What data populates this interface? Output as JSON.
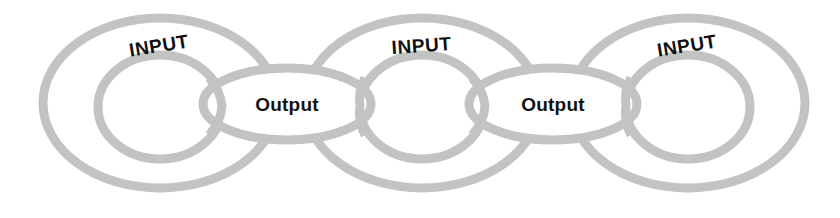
{
  "diagram": {
    "type": "chain-link-ellipses",
    "background_color": "#ffffff",
    "stroke_color": "#c3c3c3",
    "text_color": "#111111",
    "canvas": {
      "width": 840,
      "height": 218
    },
    "input_groups": [
      {
        "id": "input-group-1",
        "label": "INPUT",
        "label_rotation_deg": -9,
        "label_x": 160,
        "label_y": 52,
        "outer_ellipse": {
          "cx": 160,
          "cy": 103,
          "rx": 117,
          "ry": 85
        },
        "inner_ellipse": {
          "cx": 160,
          "cy": 107,
          "rx": 62,
          "ry": 52
        }
      },
      {
        "id": "input-group-2",
        "label": "INPUT",
        "label_rotation_deg": -4,
        "label_x": 422,
        "label_y": 52,
        "outer_ellipse": {
          "cx": 422,
          "cy": 103,
          "rx": 117,
          "ry": 85
        },
        "inner_ellipse": {
          "cx": 422,
          "cy": 107,
          "rx": 62,
          "ry": 52
        }
      },
      {
        "id": "input-group-3",
        "label": "INPUT",
        "label_rotation_deg": -9,
        "label_x": 688,
        "label_y": 52,
        "outer_ellipse": {
          "cx": 688,
          "cy": 103,
          "rx": 117,
          "ry": 85
        },
        "inner_ellipse": {
          "cx": 688,
          "cy": 107,
          "rx": 62,
          "ry": 52
        }
      }
    ],
    "output_links": [
      {
        "id": "output-link-1",
        "label": "Output",
        "label_x": 287,
        "label_y": 111,
        "ellipse": {
          "cx": 287,
          "cy": 104,
          "rx": 84,
          "ry": 36
        }
      },
      {
        "id": "output-link-2",
        "label": "Output",
        "label_x": 553,
        "label_y": 111,
        "ellipse": {
          "cx": 553,
          "cy": 104,
          "rx": 84,
          "ry": 36
        }
      }
    ]
  }
}
